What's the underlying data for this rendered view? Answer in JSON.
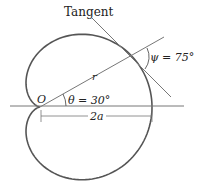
{
  "diagram": {
    "labels": {
      "tangent": "Tangent",
      "psi": "ψ = 75°",
      "theta": "θ = 30°",
      "origin": "O",
      "radius": "r",
      "distance": "2a"
    },
    "colors": {
      "curve": "#555555",
      "lines": "#777777",
      "text": "#222222"
    },
    "geometry": {
      "curve": "cardioid r = a(1 + cos θ)",
      "theta_deg": 30,
      "psi_deg": 75
    }
  }
}
